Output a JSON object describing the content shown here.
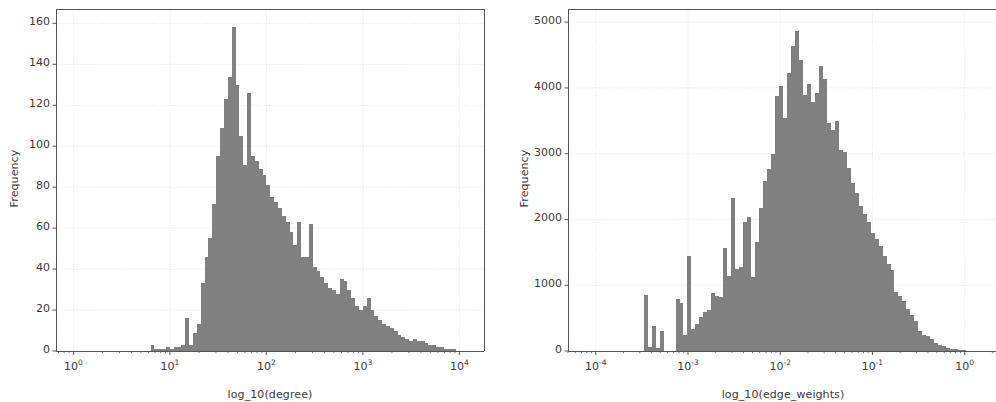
{
  "figure": {
    "width": 996,
    "height": 397,
    "background": "#ffffff",
    "bar_color": "#808080",
    "axis_color": "#3b3b3b",
    "grid_color": "#e0e0e0",
    "spine_color": "#555555"
  },
  "panels": [
    {
      "id": "degree-histogram",
      "ylabel": "Frequency",
      "xlabel": "log_10(degree)",
      "y_ticks": [
        "0",
        "20",
        "40",
        "60",
        "80",
        "100",
        "120",
        "140",
        "160"
      ],
      "x_ticks": [
        "10⁰",
        "10¹",
        "10²",
        "10³",
        "10⁴"
      ],
      "x_tick_mantissa": [
        "10",
        "10",
        "10",
        "10",
        "10"
      ],
      "x_tick_exponent": [
        "0",
        "1",
        "2",
        "3",
        "4"
      ]
    },
    {
      "id": "edge-weights-histogram",
      "ylabel": "Frequency",
      "xlabel": "log_10(edge_weights)",
      "y_ticks": [
        "0",
        "1000",
        "2000",
        "3000",
        "4000",
        "5000"
      ],
      "x_ticks": [
        "10⁻⁴",
        "10⁻³",
        "10⁻²",
        "10⁻¹",
        "10⁰"
      ],
      "x_tick_mantissa": [
        "10",
        "10",
        "10",
        "10",
        "10"
      ],
      "x_tick_exponent": [
        "-4",
        "-3",
        "-2",
        "-1",
        "0"
      ]
    }
  ],
  "chart_data": [
    {
      "type": "bar",
      "id": "degree-histogram",
      "title": "",
      "xlabel": "log_10(degree)",
      "ylabel": "Frequency",
      "xscale": "log",
      "xlim": [
        0.66,
        18000
      ],
      "ylim": [
        0,
        167
      ],
      "grid": true,
      "legend": null,
      "bar_color": "#808080",
      "x_tick_values": [
        1,
        10,
        100,
        1000,
        10000
      ],
      "y_tick_values": [
        0,
        20,
        40,
        60,
        80,
        100,
        120,
        140,
        160
      ],
      "note": "Histogram of node degree on a log x-axis; 100 log-spaced bins over the range 1 to 10000. values[] are per-bin frequencies, bin_left_edges[] the matching left edges in degree units.",
      "bin_left_edges": [
        1.0,
        1.096,
        1.202,
        1.318,
        1.445,
        1.585,
        1.738,
        1.905,
        2.089,
        2.291,
        2.512,
        2.754,
        3.02,
        3.311,
        3.631,
        3.981,
        4.365,
        4.786,
        5.248,
        5.754,
        6.31,
        6.918,
        7.586,
        8.318,
        9.12,
        10.0,
        10.96,
        12.02,
        13.18,
        14.45,
        15.85,
        17.38,
        19.05,
        20.89,
        22.91,
        25.12,
        27.54,
        30.2,
        33.11,
        36.31,
        39.81,
        43.65,
        47.86,
        52.48,
        57.54,
        63.1,
        69.18,
        75.86,
        83.18,
        91.2,
        100.0,
        109.6,
        120.2,
        131.8,
        144.5,
        158.5,
        173.8,
        190.5,
        208.9,
        229.1,
        251.2,
        275.4,
        302.0,
        331.1,
        363.1,
        398.1,
        436.5,
        478.6,
        524.8,
        575.4,
        631.0,
        691.8,
        758.6,
        831.8,
        912.0,
        1000.0,
        1096.0,
        1202.0,
        1318.0,
        1445.0,
        1585.0,
        1738.0,
        1905.0,
        2089.0,
        2291.0,
        2512.0,
        2754.0,
        3020.0,
        3311.0,
        3631.0,
        3981.0,
        4365.0,
        4786.0,
        5248.0,
        5754.0,
        6310.0,
        6918.0,
        7586.0,
        8318.0,
        9120.0
      ],
      "values": [
        0,
        0,
        0,
        0,
        0,
        0,
        0,
        0,
        0,
        0,
        0,
        0,
        0,
        0,
        0,
        0,
        0,
        0,
        0,
        0,
        3,
        1,
        1,
        1,
        2,
        1,
        2,
        2,
        3,
        16,
        3,
        9,
        13,
        33,
        46,
        55,
        72,
        95,
        109,
        123,
        134,
        158,
        130,
        105,
        91,
        126,
        95,
        93,
        89,
        86,
        81,
        75,
        73,
        70,
        66,
        63,
        58,
        52,
        63,
        46,
        46,
        62,
        41,
        39,
        36,
        33,
        31,
        30,
        28,
        35,
        34,
        30,
        26,
        22,
        20,
        22,
        26,
        20,
        17,
        15,
        13,
        12,
        11,
        10,
        8,
        7,
        6,
        5,
        6,
        5,
        5,
        4,
        3,
        3,
        2,
        2,
        1,
        1,
        1,
        0
      ]
    },
    {
      "type": "bar",
      "id": "edge-weights-histogram",
      "title": "",
      "xlabel": "log_10(edge_weights)",
      "ylabel": "Frequency",
      "xscale": "log",
      "xlim": [
        5e-05,
        2.3
      ],
      "ylim": [
        0,
        5200
      ],
      "grid": true,
      "legend": null,
      "bar_color": "#808080",
      "x_tick_values": [
        0.0001,
        0.001,
        0.01,
        0.1,
        1
      ],
      "y_tick_values": [
        0,
        1000,
        2000,
        3000,
        4000,
        5000
      ],
      "note": "Histogram of edge weights on a log x-axis; 100 log-spaced bins from 1e-4.3 to 1e0.36. values[] are per-bin frequencies, bin_left_edges[] the matching left edges in weight units.",
      "bin_left_edges": [
        5e-05,
        5.52e-05,
        6.1e-05,
        6.74e-05,
        7.44e-05,
        8.22e-05,
        9.08e-05,
        0.0001003,
        0.0001108,
        0.0001224,
        0.0001352,
        0.0001493,
        0.0001649,
        0.0001821,
        0.0002012,
        0.0002222,
        0.0002454,
        0.0002711,
        0.0002994,
        0.0003307,
        0.0003653,
        0.0004035,
        0.0004457,
        0.0004923,
        0.0005437,
        0.0006005,
        0.0006633,
        0.0007326,
        0.0008092,
        0.0008938,
        0.0009872,
        0.0010904,
        0.0012044,
        0.0013303,
        0.0014693,
        0.0016229,
        0.0017926,
        0.0019799,
        0.0021868,
        0.0024154,
        0.0026679,
        0.0029467,
        0.0032547,
        0.0035949,
        0.0039707,
        0.0043857,
        0.0048441,
        0.0053504,
        0.0059096,
        0.0065273,
        0.0072095,
        0.0079631,
        0.0087954,
        0.0097147,
        0.0107299,
        0.011851,
        0.01309,
        0.014458,
        0.015969,
        0.017638,
        0.019481,
        0.021517,
        0.023766,
        0.02625,
        0.028993,
        0.032023,
        0.03537,
        0.039067,
        0.04315,
        0.04766,
        0.052641,
        0.058142,
        0.064219,
        0.070931,
        0.078345,
        0.086533,
        0.095578,
        0.105568,
        0.116602,
        0.128789,
        0.14225,
        0.157117,
        0.173538,
        0.191675,
        0.211706,
        0.233831,
        0.258271,
        0.285266,
        0.315084,
        0.348021,
        0.384403,
        0.424591,
        0.468983,
        0.518021,
        0.572192,
        0.632034,
        0.698142,
        0.771176,
        0.851864,
        0.941013
      ],
      "values": [
        0,
        0,
        0,
        0,
        0,
        0,
        0,
        0,
        0,
        0,
        0,
        0,
        0,
        0,
        0,
        0,
        0,
        0,
        0,
        850,
        60,
        380,
        40,
        300,
        0,
        0,
        0,
        790,
        730,
        250,
        1450,
        330,
        410,
        520,
        600,
        620,
        880,
        830,
        820,
        1560,
        1140,
        2320,
        1240,
        1280,
        1960,
        2040,
        1120,
        1660,
        2180,
        2580,
        2760,
        3000,
        3880,
        4030,
        3540,
        4230,
        4640,
        4860,
        4420,
        3900,
        4060,
        3780,
        3920,
        4340,
        4130,
        3460,
        3360,
        3500,
        3050,
        3030,
        2790,
        2560,
        2400,
        2200,
        2080,
        1960,
        1800,
        1710,
        1590,
        1450,
        1330,
        1230,
        900,
        830,
        760,
        640,
        540,
        460,
        300,
        250,
        230,
        180,
        120,
        90,
        70,
        50,
        35,
        25,
        18,
        10
      ]
    }
  ]
}
